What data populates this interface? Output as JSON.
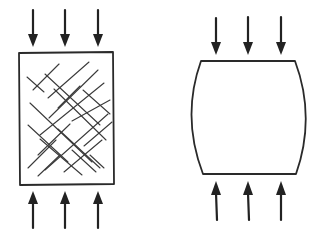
{
  "diagram": {
    "colors": {
      "line": "#2a2a2a",
      "background": "#ffffff"
    },
    "specimens": [
      {
        "id": "cracked-block",
        "shape": "rectangle",
        "bounds": {
          "x1": 18,
          "y1": 52,
          "x2": 113,
          "y2": 184
        },
        "pattern": "diagonal-cross-hatch-cracks",
        "arrows_top": [
          33,
          65,
          98
        ],
        "arrows_bottom": [
          33,
          65,
          98
        ],
        "arrow_direction_top": "down",
        "arrow_direction_bottom": "up"
      },
      {
        "id": "barreled-block",
        "shape": "barrel",
        "bounds": {
          "x1": 192,
          "y1": 61,
          "x2": 305,
          "y2": 174
        },
        "pattern": "none",
        "arrows_top": [
          216,
          248,
          281
        ],
        "arrows_bottom": [
          216,
          248,
          281
        ],
        "arrow_direction_top": "down",
        "arrow_direction_bottom": "up"
      }
    ]
  }
}
